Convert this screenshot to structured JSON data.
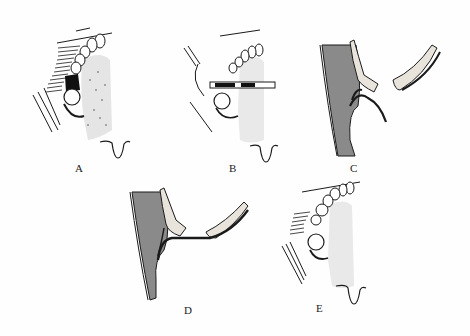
{
  "figure": {
    "panels": [
      {
        "id": "A",
        "label": "A",
        "content": "maxillary teeth with palate stippling, impacted molar, cheek lines"
      },
      {
        "id": "B",
        "label": "B",
        "content": "maxillary teeth with retractor instrument across buccal area"
      },
      {
        "id": "C",
        "label": "C",
        "content": "cross-section of tissue layers with separated flap"
      },
      {
        "id": "D",
        "label": "D",
        "content": "cross-section of tissue layers with sutured/curved flap"
      },
      {
        "id": "E",
        "label": "E",
        "content": "maxillary teeth with healed palate and uvula"
      }
    ],
    "colors": {
      "ink": "#1a1a1a",
      "shade": "#8a8a8a",
      "background": "#fefefe",
      "bone": "#e8e4dc"
    }
  }
}
